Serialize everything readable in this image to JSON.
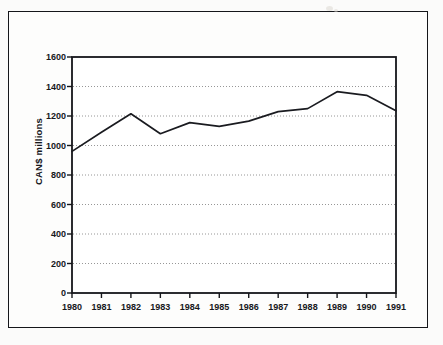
{
  "figure": {
    "frame": "outer-border",
    "background_color": "#fbfbfa",
    "line_color": "#15161a"
  },
  "chart_data": {
    "type": "line",
    "title": "",
    "subtitle": "",
    "xlabel": "",
    "ylabel": "CAN$ millions",
    "categories": [
      "1980",
      "1981",
      "1982",
      "1983",
      "1984",
      "1985",
      "1986",
      "1987",
      "1988",
      "1989",
      "1990",
      "1991"
    ],
    "values": [
      960,
      1090,
      1215,
      1080,
      1155,
      1130,
      1165,
      1230,
      1250,
      1365,
      1340,
      1235
    ],
    "series": [
      {
        "name": "CAN$ millions",
        "values": [
          960,
          1090,
          1215,
          1080,
          1155,
          1130,
          1165,
          1230,
          1250,
          1365,
          1340,
          1235
        ]
      }
    ],
    "ylim": [
      0,
      1600
    ],
    "ytick_step": 200,
    "yticks": [
      0,
      200,
      400,
      600,
      800,
      1000,
      1200,
      1400,
      1600
    ],
    "ytick_labels": [
      "0",
      "200",
      "400",
      "600",
      "800",
      "1000",
      "1200",
      "1400",
      "1600"
    ],
    "xticks": [
      "1980",
      "1981",
      "1982",
      "1983",
      "1984",
      "1985",
      "1986",
      "1987",
      "1988",
      "1989",
      "1990",
      "1991"
    ],
    "grid": true,
    "grid_axis": "y",
    "grid_style": "dotted",
    "legend": false,
    "legend_position": "none",
    "line_color": "#1a1b20",
    "markers": false,
    "annotations": []
  }
}
